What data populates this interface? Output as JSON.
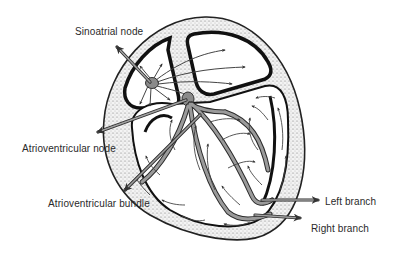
{
  "diagram": {
    "colors": {
      "background": "#ffffff",
      "outline": "#111111",
      "pathway_fill": "#8a8a8a",
      "pathway_stroke": "#2a2a2a",
      "stipple": "#777777",
      "label_text": "#2a2a2a"
    },
    "labels": {
      "sinoatrial_node": "Sinoatrial node",
      "atrioventricular_node": "Atrioventricular node",
      "atrioventricular_bundle": "Atrioventricular bundle",
      "left_branch": "Left branch",
      "right_branch": "Right branch"
    }
  }
}
